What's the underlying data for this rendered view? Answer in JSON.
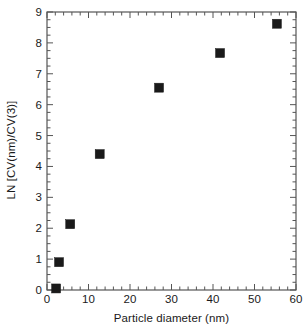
{
  "chart_data": {
    "type": "scatter",
    "title": "",
    "xlabel": "Particle diameter (nm)",
    "ylabel": "LN [CV(nm)/CV(3)]",
    "xlim": [
      0,
      60
    ],
    "ylim": [
      0,
      9
    ],
    "xticks": [
      0,
      10,
      20,
      30,
      40,
      50,
      60
    ],
    "yticks": [
      0,
      1,
      2,
      3,
      4,
      5,
      6,
      7,
      8,
      9
    ],
    "xtick_labels": [
      "0",
      "10",
      "20",
      "30",
      "40",
      "50",
      "60"
    ],
    "ytick_labels": [
      "0",
      "1",
      "2",
      "3",
      "4",
      "5",
      "6",
      "7",
      "8",
      "9"
    ],
    "x_minor_step": 2,
    "y_minor_step": 0.25,
    "grid": false,
    "legend": false,
    "marker": "square",
    "marker_color": "#1a1a1a",
    "marker_size": 9,
    "x": [
      2.2,
      2.9,
      5.6,
      12.7,
      27.0,
      41.7,
      55.4
    ],
    "y": [
      0.05,
      0.9,
      2.13,
      4.4,
      6.55,
      7.67,
      8.62
    ],
    "points": [
      {
        "x": 2.2,
        "y": 0.05
      },
      {
        "x": 2.9,
        "y": 0.9
      },
      {
        "x": 5.6,
        "y": 2.13
      },
      {
        "x": 12.7,
        "y": 4.4
      },
      {
        "x": 27.0,
        "y": 6.55
      },
      {
        "x": 41.7,
        "y": 7.67
      },
      {
        "x": 55.4,
        "y": 8.62
      }
    ]
  },
  "axes": {
    "frame_color": "#555555",
    "background": "#ffffff"
  }
}
